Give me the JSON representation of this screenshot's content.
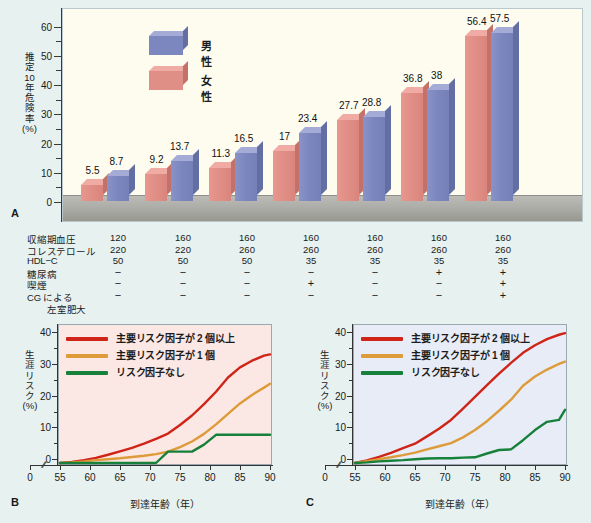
{
  "panel_a": {
    "letter": "A",
    "y_title_lines": [
      "推",
      "定",
      "10",
      "年",
      "危",
      "険",
      "率",
      "(%)"
    ],
    "y_ticks": [
      0,
      10,
      20,
      30,
      40,
      50,
      60
    ],
    "legend": [
      {
        "label": "男性",
        "color": "#7d87bf",
        "key": "male"
      },
      {
        "label": "女性",
        "color": "#e08f87",
        "key": "female"
      }
    ]
  },
  "chart_data": [
    {
      "type": "bar",
      "id": "A",
      "title": "",
      "ylabel": "推定10年危険率 (%)",
      "xlabel": "",
      "ylim": [
        0,
        65
      ],
      "y_ticks": [
        0,
        10,
        20,
        30,
        40,
        50,
        60
      ],
      "grid": false,
      "legend_position": "top-left",
      "categories": [
        "1",
        "2",
        "3",
        "4",
        "5",
        "6",
        "7"
      ],
      "series": [
        {
          "name": "女性",
          "color": "#e08f87",
          "values": [
            5.5,
            9.2,
            11.3,
            17,
            27.7,
            36.8,
            56.4
          ]
        },
        {
          "name": "男性",
          "color": "#7d87bf",
          "values": [
            8.7,
            13.7,
            16.5,
            23.4,
            28.8,
            38,
            57.5
          ]
        }
      ],
      "risk_factor_table": {
        "row_labels": [
          "収縮期血圧",
          "コレステロール",
          "HDL−C",
          "糖尿病",
          "喫煙",
          "CG による",
          "左室肥大"
        ],
        "rows": [
          {
            "label": "収縮期血圧",
            "values": [
              "120",
              "160",
              "160",
              "160",
              "160",
              "160",
              "160"
            ]
          },
          {
            "label": "コレステロール",
            "values": [
              "220",
              "220",
              "260",
              "260",
              "260",
              "260",
              "260"
            ]
          },
          {
            "label": "HDL−C",
            "values": [
              "50",
              "50",
              "50",
              "35",
              "35",
              "35",
              "35"
            ]
          },
          {
            "label": "糖尿病",
            "values": [
              "−",
              "−",
              "−",
              "−",
              "−",
              "+",
              "+"
            ]
          },
          {
            "label": "喫煙",
            "values": [
              "−",
              "−",
              "−",
              "+",
              "−",
              "−",
              "+"
            ]
          },
          {
            "label": "CG による",
            "values": [
              "−",
              "−",
              "−",
              "−",
              "−",
              "−",
              "+"
            ]
          },
          {
            "label": "左室肥大",
            "values": [
              "",
              "",
              "",
              "",
              "",
              "",
              ""
            ]
          }
        ]
      }
    },
    {
      "type": "line",
      "id": "B",
      "title": "",
      "ylabel": "生涯リスク (%)",
      "xlabel": "到達年齢（年）",
      "xlim": [
        55,
        90
      ],
      "ylim": [
        0,
        42
      ],
      "y_ticks": [
        0,
        10,
        20,
        30,
        40
      ],
      "x_ticks": [
        0,
        55,
        60,
        65,
        70,
        75,
        80,
        85,
        90
      ],
      "axis_break": true,
      "grid": false,
      "legend_position": "top-left",
      "x": [
        55,
        57,
        59,
        61,
        63,
        65,
        67,
        69,
        71,
        73,
        75,
        77,
        79,
        81,
        83,
        85,
        87,
        89,
        90
      ],
      "series": [
        {
          "name": "主要リスク因子が2個以上",
          "color": "#cf2417",
          "values": [
            0,
            0.3,
            0.9,
            1.6,
            2.6,
            3.7,
            4.8,
            6.1,
            7.6,
            9.3,
            12.0,
            15.0,
            18.6,
            22.5,
            27.0,
            30.2,
            32.3,
            33.9,
            34.3
          ]
        },
        {
          "name": "主要リスク因子が1個",
          "color": "#dd9b3a",
          "values": [
            0,
            0.2,
            0.5,
            0.9,
            1.2,
            1.5,
            1.9,
            2.3,
            2.8,
            3.6,
            5.0,
            6.8,
            9.2,
            12.2,
            15.5,
            18.8,
            21.5,
            23.8,
            25.0
          ]
        },
        {
          "name": "リスク因子なし",
          "color": "#17803a",
          "values": [
            0,
            0,
            0,
            0,
            0,
            0,
            0,
            0,
            0,
            3.6,
            3.6,
            3.6,
            5.8,
            8.9,
            8.9,
            8.9,
            8.9,
            8.9,
            8.9
          ]
        }
      ]
    },
    {
      "type": "line",
      "id": "C",
      "title": "",
      "ylabel": "生涯リスク (%)",
      "xlabel": "到達年齢（年）",
      "xlim": [
        55,
        90
      ],
      "ylim": [
        0,
        42
      ],
      "y_ticks": [
        0,
        10,
        20,
        30,
        40
      ],
      "x_ticks": [
        0,
        55,
        60,
        65,
        70,
        75,
        80,
        85,
        90
      ],
      "axis_break": true,
      "grid": false,
      "legend_position": "top-left",
      "x": [
        55,
        57,
        59,
        61,
        63,
        65,
        67,
        69,
        71,
        73,
        75,
        77,
        79,
        81,
        83,
        85,
        87,
        89,
        90
      ],
      "series": [
        {
          "name": "主要リスク因子が2個以上",
          "color": "#cf2417",
          "values": [
            0,
            0.8,
            1.9,
            3.2,
            4.7,
            6.1,
            8.4,
            10.8,
            13.6,
            17.2,
            20.9,
            24.6,
            28.2,
            31.6,
            34.8,
            37.2,
            39.1,
            40.5,
            41.0
          ]
        },
        {
          "name": "主要リスク因子が1個",
          "color": "#dd9b3a",
          "values": [
            0,
            0.6,
            1.2,
            1.8,
            2.5,
            3.3,
            4.3,
            5.3,
            6.3,
            8.1,
            10.4,
            13.2,
            16.5,
            20.0,
            24.4,
            27.3,
            29.5,
            31.3,
            32.0
          ]
        },
        {
          "name": "リスク因子なし",
          "color": "#17803a",
          "values": [
            0,
            0.2,
            0.5,
            0.7,
            0.9,
            1.2,
            1.4,
            1.5,
            1.5,
            1.7,
            1.8,
            3.0,
            4.1,
            4.3,
            7.2,
            10.4,
            13.0,
            13.6,
            16.8
          ]
        }
      ]
    }
  ],
  "panel_b": {
    "letter": "B"
  },
  "panel_c": {
    "letter": "C"
  },
  "line_legend": [
    {
      "label": "主要リスク因子が 2 個以上",
      "color": "#cf2417"
    },
    {
      "label": "主要リスク因子が 1 個",
      "color": "#dd9b3a"
    },
    {
      "label": "リスク因子なし",
      "color": "#17803a"
    }
  ],
  "line_axis": {
    "y_title_lines": [
      "生",
      "涯",
      "リ",
      "ス",
      "ク",
      "(%)"
    ],
    "x_title": "到達年齢（年）",
    "y_ticks": [
      "0",
      "10",
      "20",
      "30",
      "40"
    ],
    "x_ticks": [
      "0",
      "55",
      "60",
      "65",
      "70",
      "75",
      "80",
      "85",
      "90"
    ]
  },
  "colors": {
    "page_bg": "#e6f1f0",
    "bar_plot_bg": "#fdfcef",
    "panel_b_bg": "#fbe7e4",
    "panel_c_bg": "#e7ecf6",
    "male": "#7d87bf",
    "female": "#e08f87",
    "risk2plus": "#cf2417",
    "risk1": "#dd9b3a",
    "risk0": "#17803a"
  }
}
